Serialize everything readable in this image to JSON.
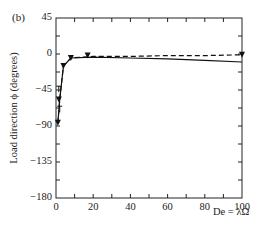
{
  "chart_data": {
    "type": "line",
    "panel_label": "(b)",
    "title": "",
    "xlabel": "De = λΩ",
    "ylabel": "Load direction ϕ (degrees)",
    "xlim": [
      0,
      100
    ],
    "ylim": [
      -180,
      45
    ],
    "xticks": [
      0,
      20,
      40,
      60,
      80,
      100
    ],
    "xtick_labels": [
      "0",
      "20",
      "40",
      "60",
      "80",
      "100"
    ],
    "yticks": [
      45,
      0,
      -45,
      -90,
      -135,
      -180
    ],
    "ytick_labels": [
      "45",
      "0",
      "−45",
      "−90",
      "−135",
      "−180"
    ],
    "grid": false,
    "legend": null,
    "series": [
      {
        "name": "theory (solid)",
        "style": "solid",
        "x": [
          1,
          2,
          4,
          8,
          20,
          40,
          60,
          80,
          100
        ],
        "y": [
          -86,
          -57,
          -15,
          -5,
          -4,
          -5,
          -6,
          -8,
          -10
        ]
      },
      {
        "name": "theory (dashed)",
        "style": "dashed",
        "x": [
          1,
          2,
          4,
          8,
          20,
          40,
          60,
          80,
          100
        ],
        "y": [
          -86,
          -57,
          -15,
          -5,
          -3,
          -3,
          -2,
          -2,
          -1
        ]
      },
      {
        "name": "experiment (triangles)",
        "style": "markers",
        "marker": "triangle-down",
        "x": [
          1,
          1.5,
          4,
          8,
          17,
          100
        ],
        "y": [
          -86,
          -57,
          -15,
          -5,
          -2,
          -1
        ]
      },
      {
        "name": "experiment (T-markers)",
        "style": "markers",
        "marker": "tee",
        "x": [
          1.5,
          2
        ],
        "y": [
          -44,
          -69
        ]
      }
    ]
  }
}
